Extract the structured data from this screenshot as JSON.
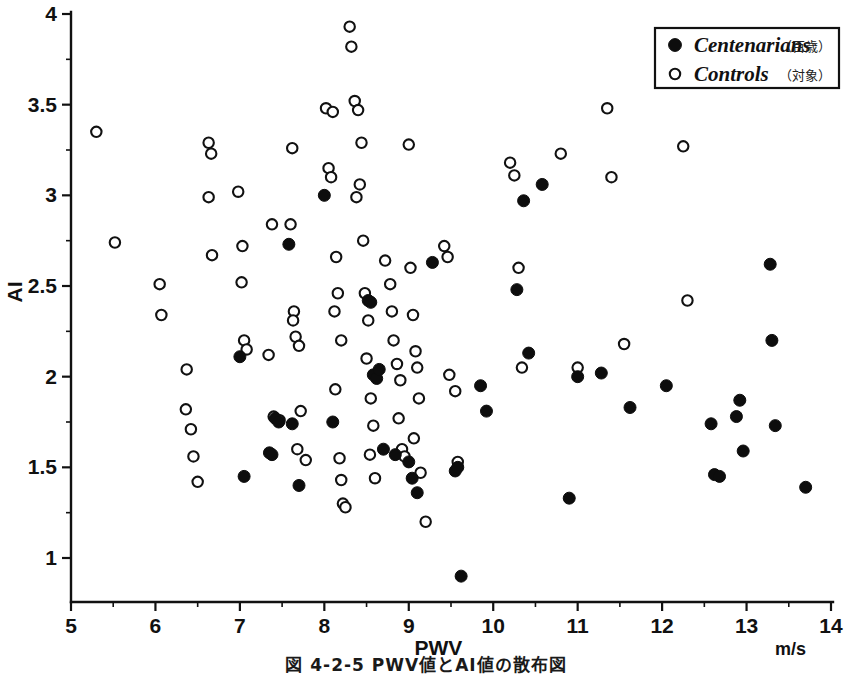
{
  "caption": "図 4-2-5  PWV値とAI値の散布図",
  "legend": {
    "position": "top-right",
    "entries": [
      {
        "marker": "filled-circle",
        "label": "Centenarians",
        "note": "（百歳）"
      },
      {
        "marker": "open-circle",
        "label": "Controls",
        "note": "（対象）"
      }
    ]
  },
  "axes": {
    "x": {
      "title": "PWV",
      "units": "m/s",
      "min": 5,
      "max": 14,
      "ticks": [
        "5",
        "6",
        "7",
        "8",
        "9",
        "10",
        "11",
        "12",
        "13",
        "14"
      ],
      "minor_step": 0.5
    },
    "y": {
      "title": "AI",
      "min": 0.8,
      "max": 4,
      "ticks": [
        "1",
        "1.5",
        "2",
        "2.5",
        "3",
        "3.5",
        "4"
      ],
      "minor_step": 0.25
    }
  },
  "colors": {
    "axis": "#111111",
    "centenarians": "#0d0d0d",
    "controls_stroke": "#111111",
    "controls_fill": "#ffffff",
    "background": "#ffffff"
  },
  "chart_data": {
    "type": "scatter",
    "title": "図 4-2-5  PWV値とAI値の散布図",
    "xlabel": "PWV",
    "ylabel": "AI",
    "xunits": "m/s",
    "xlim": [
      5,
      14
    ],
    "ylim": [
      0.8,
      4
    ],
    "grid": false,
    "legend_position": "upper right",
    "series": [
      {
        "name": "Controls",
        "note": "（対象）",
        "marker": "open-circle",
        "points": [
          [
            5.3,
            3.35
          ],
          [
            5.52,
            2.74
          ],
          [
            6.05,
            2.51
          ],
          [
            6.07,
            2.34
          ],
          [
            6.37,
            2.04
          ],
          [
            6.36,
            1.82
          ],
          [
            6.42,
            1.71
          ],
          [
            6.45,
            1.56
          ],
          [
            6.5,
            1.42
          ],
          [
            6.63,
            3.29
          ],
          [
            6.66,
            3.23
          ],
          [
            6.63,
            2.99
          ],
          [
            6.67,
            2.67
          ],
          [
            6.98,
            3.02
          ],
          [
            7.03,
            2.72
          ],
          [
            7.02,
            2.52
          ],
          [
            7.05,
            2.2
          ],
          [
            7.08,
            2.15
          ],
          [
            7.38,
            2.84
          ],
          [
            7.34,
            2.12
          ],
          [
            7.4,
            1.78
          ],
          [
            7.47,
            1.76
          ],
          [
            7.62,
            3.26
          ],
          [
            7.6,
            2.84
          ],
          [
            7.64,
            2.36
          ],
          [
            7.63,
            2.31
          ],
          [
            7.66,
            2.22
          ],
          [
            7.7,
            2.17
          ],
          [
            7.72,
            1.81
          ],
          [
            7.68,
            1.6
          ],
          [
            7.78,
            1.54
          ],
          [
            8.02,
            3.48
          ],
          [
            8.1,
            3.46
          ],
          [
            8.05,
            3.15
          ],
          [
            8.08,
            3.1
          ],
          [
            8.14,
            2.66
          ],
          [
            8.16,
            2.46
          ],
          [
            8.12,
            2.36
          ],
          [
            8.2,
            2.2
          ],
          [
            8.13,
            1.93
          ],
          [
            8.18,
            1.55
          ],
          [
            8.2,
            1.43
          ],
          [
            8.22,
            1.3
          ],
          [
            8.25,
            1.28
          ],
          [
            8.3,
            3.93
          ],
          [
            8.32,
            3.82
          ],
          [
            8.36,
            3.52
          ],
          [
            8.4,
            3.47
          ],
          [
            8.44,
            3.29
          ],
          [
            8.42,
            3.06
          ],
          [
            8.38,
            2.99
          ],
          [
            8.46,
            2.75
          ],
          [
            8.48,
            2.46
          ],
          [
            8.52,
            2.31
          ],
          [
            8.5,
            2.1
          ],
          [
            8.55,
            1.88
          ],
          [
            8.58,
            1.73
          ],
          [
            8.54,
            1.57
          ],
          [
            8.6,
            1.44
          ],
          [
            8.72,
            2.64
          ],
          [
            8.78,
            2.51
          ],
          [
            8.8,
            2.36
          ],
          [
            8.82,
            2.2
          ],
          [
            8.86,
            2.07
          ],
          [
            8.9,
            1.98
          ],
          [
            8.88,
            1.77
          ],
          [
            8.92,
            1.6
          ],
          [
            8.95,
            1.56
          ],
          [
            9.0,
            3.28
          ],
          [
            9.02,
            2.6
          ],
          [
            9.05,
            2.34
          ],
          [
            9.08,
            2.14
          ],
          [
            9.1,
            2.05
          ],
          [
            9.12,
            1.88
          ],
          [
            9.06,
            1.66
          ],
          [
            9.14,
            1.47
          ],
          [
            9.2,
            1.2
          ],
          [
            9.42,
            2.72
          ],
          [
            9.46,
            2.66
          ],
          [
            9.48,
            2.01
          ],
          [
            9.55,
            1.92
          ],
          [
            9.58,
            1.53
          ],
          [
            10.2,
            3.18
          ],
          [
            10.25,
            3.11
          ],
          [
            10.3,
            2.6
          ],
          [
            10.34,
            2.05
          ],
          [
            10.8,
            3.23
          ],
          [
            11.0,
            2.05
          ],
          [
            11.35,
            3.48
          ],
          [
            11.4,
            3.1
          ],
          [
            11.55,
            2.18
          ],
          [
            12.25,
            3.27
          ],
          [
            12.3,
            2.42
          ]
        ]
      },
      {
        "name": "Centenarians",
        "note": "（百歳）",
        "marker": "filled-circle",
        "points": [
          [
            7.0,
            2.11
          ],
          [
            7.05,
            1.45
          ],
          [
            7.35,
            1.58
          ],
          [
            7.38,
            1.57
          ],
          [
            7.42,
            1.77
          ],
          [
            7.46,
            1.75
          ],
          [
            7.58,
            2.73
          ],
          [
            7.62,
            1.74
          ],
          [
            7.7,
            1.4
          ],
          [
            8.0,
            3.0
          ],
          [
            8.1,
            1.75
          ],
          [
            8.52,
            2.42
          ],
          [
            8.55,
            2.41
          ],
          [
            8.58,
            2.01
          ],
          [
            8.62,
            1.99
          ],
          [
            8.65,
            2.04
          ],
          [
            8.7,
            1.6
          ],
          [
            8.84,
            1.57
          ],
          [
            9.0,
            1.53
          ],
          [
            9.04,
            1.44
          ],
          [
            9.1,
            1.36
          ],
          [
            9.28,
            2.63
          ],
          [
            9.55,
            1.48
          ],
          [
            9.58,
            1.5
          ],
          [
            9.62,
            0.9
          ],
          [
            9.85,
            1.95
          ],
          [
            9.92,
            1.81
          ],
          [
            10.28,
            2.48
          ],
          [
            10.36,
            2.97
          ],
          [
            10.42,
            2.13
          ],
          [
            10.58,
            3.06
          ],
          [
            10.9,
            1.33
          ],
          [
            11.0,
            2.0
          ],
          [
            11.28,
            2.02
          ],
          [
            11.62,
            1.83
          ],
          [
            12.05,
            1.95
          ],
          [
            12.58,
            1.74
          ],
          [
            12.62,
            1.46
          ],
          [
            12.68,
            1.45
          ],
          [
            12.88,
            1.78
          ],
          [
            12.92,
            1.87
          ],
          [
            12.96,
            1.59
          ],
          [
            13.28,
            2.62
          ],
          [
            13.3,
            2.2
          ],
          [
            13.34,
            1.73
          ],
          [
            13.7,
            1.39
          ]
        ]
      }
    ]
  }
}
